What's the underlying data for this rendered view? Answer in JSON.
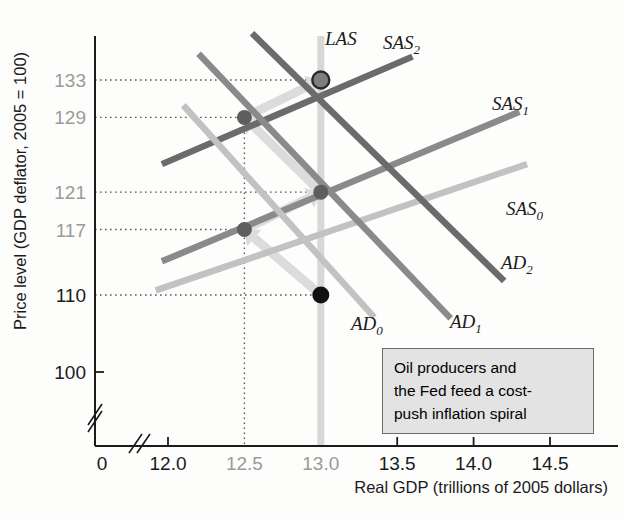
{
  "chart_data": {
    "type": "line",
    "title": "",
    "xlabel": "Real GDP (trillions of 2005 dollars)",
    "ylabel": "Price level (GDP deflator, 2005 = 100)",
    "xticks": [
      "0",
      "12.0",
      "12.5",
      "13.0",
      "13.5",
      "14.0",
      "14.5"
    ],
    "xtick_values": [
      0,
      12.0,
      12.5,
      13.0,
      13.5,
      14.0,
      14.5
    ],
    "xtick_highlight": [
      false,
      false,
      true,
      true,
      false,
      false,
      false
    ],
    "yticks": [
      "133",
      "129",
      "121",
      "117",
      "110",
      "100"
    ],
    "ytick_values": [
      133,
      129,
      121,
      117,
      110,
      100
    ],
    "ytick_highlight": [
      true,
      true,
      true,
      true,
      false,
      false
    ],
    "xlim": [
      11.75,
      14.9
    ],
    "ylim": [
      96,
      137
    ],
    "axis_break_x": true,
    "axis_break_y": true,
    "grid": "dotted-reference-lines",
    "legend": "inline-curve-labels",
    "series": [
      {
        "name": "LAS",
        "label": "LAS",
        "type": "vertical",
        "x": 13.0,
        "color": "#d8d8d8"
      },
      {
        "name": "SAS0",
        "label": "SAS",
        "sub": "0",
        "type": "upward",
        "color": "#c2c2c2",
        "points": [
          [
            11.92,
            110.5
          ],
          [
            14.35,
            124.0
          ]
        ]
      },
      {
        "name": "SAS1",
        "label": "SAS",
        "sub": "1",
        "type": "upward",
        "color": "#8a8a8a",
        "points": [
          [
            11.96,
            113.6
          ],
          [
            14.3,
            129.6
          ]
        ]
      },
      {
        "name": "SAS2",
        "label": "SAS",
        "sub": "2",
        "type": "upward",
        "color": "#6b6b6b",
        "points": [
          [
            11.96,
            124.0
          ],
          [
            13.6,
            135.5
          ]
        ]
      },
      {
        "name": "AD0",
        "label": "AD",
        "sub": "0",
        "type": "downward",
        "color": "#c2c2c2",
        "points": [
          [
            12.1,
            130.3
          ],
          [
            13.35,
            107.6
          ]
        ]
      },
      {
        "name": "AD1",
        "label": "AD",
        "sub": "1",
        "type": "downward",
        "color": "#8a8a8a",
        "points": [
          [
            12.2,
            135.8
          ],
          [
            13.85,
            107.5
          ]
        ]
      },
      {
        "name": "AD2",
        "label": "AD",
        "sub": "2",
        "type": "downward",
        "color": "#6b6b6b",
        "points": [
          [
            12.55,
            138.0
          ],
          [
            14.2,
            111.5
          ]
        ]
      }
    ],
    "equilibria": [
      {
        "label": "",
        "x": 13.0,
        "y": 110,
        "style": "filled-black"
      },
      {
        "label": "",
        "x": 12.5,
        "y": 117,
        "style": "filled-gray"
      },
      {
        "label": "",
        "x": 13.0,
        "y": 121,
        "style": "filled-gray"
      },
      {
        "label": "",
        "x": 12.5,
        "y": 129,
        "style": "filled-gray"
      },
      {
        "label": "",
        "x": 13.0,
        "y": 133,
        "style": "open-ring"
      }
    ],
    "arrows": [
      {
        "from": [
          13.0,
          110
        ],
        "to": [
          12.5,
          117
        ]
      },
      {
        "from": [
          12.5,
          117
        ],
        "to": [
          13.0,
          121
        ]
      },
      {
        "from": [
          13.0,
          121
        ],
        "to": [
          12.5,
          129
        ]
      },
      {
        "from": [
          12.5,
          129
        ],
        "to": [
          13.0,
          133
        ]
      }
    ],
    "annotation": {
      "lines": [
        "Oil producers and",
        "the Fed feed a cost-",
        "push inflation spiral"
      ],
      "background": "#e3e3e3",
      "border": "#6b6b6b"
    }
  },
  "colors": {
    "axis": "#1b1b1b",
    "tick_gray": "#9a9a9a",
    "las": "#d8d8d8",
    "light_curve": "#c2c2c2",
    "mid_curve": "#8a8a8a",
    "dark_curve": "#6b6b6b",
    "arrow": "#dcdcdc",
    "dotted": "#5a5a5a"
  }
}
